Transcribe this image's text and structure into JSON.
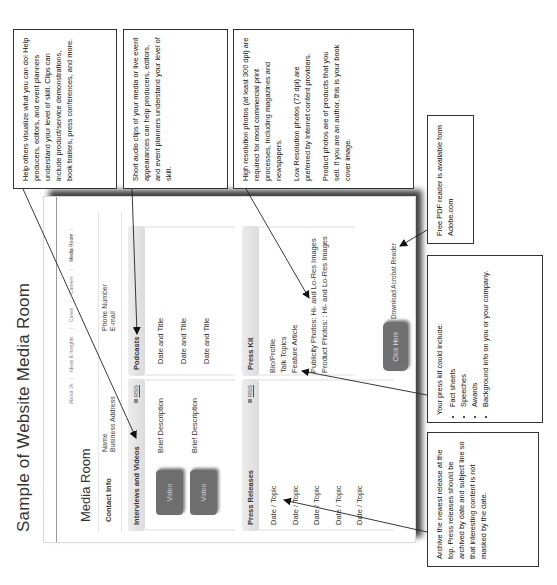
{
  "document": {
    "title": "Sample of Website Media Room"
  },
  "website": {
    "nav": {
      "items": [
        {
          "label": "About Us",
          "active": false
        },
        {
          "label": "Ideas & Insights",
          "active": false
        },
        {
          "label": "Cases",
          "active": false
        },
        {
          "label": "Careers",
          "active": false
        },
        {
          "label": "Media Room",
          "active": true
        }
      ]
    },
    "heading": "Media Room",
    "contact": {
      "label": "Contact Info",
      "name": "Name",
      "address": "Business Address",
      "phone": "Phone Number",
      "email": "E-mail"
    },
    "interviews": {
      "title": "Interviews and Videos",
      "rss": "RSS",
      "items": [
        {
          "button": "Video",
          "description": "Brief Description"
        },
        {
          "button": "Video",
          "description": "Brief Description"
        }
      ]
    },
    "podcasts": {
      "title": "Podcasts",
      "items": [
        "Date and Title",
        "Date and Title",
        "Date and Title"
      ]
    },
    "press_releases": {
      "title": "Press Releases",
      "rss": "RSS",
      "items": [
        "Date / Topic",
        "Date / Topic",
        "Date / Topic",
        "Date / Topic",
        "Date / Topic"
      ]
    },
    "press_kit": {
      "title": "Press Kit",
      "items": [
        "Bio/Profile",
        "Talk Topics",
        "Feature Article"
      ],
      "photos": [
        "Publicity Photos: Hi- and Lo-Res Images",
        "Product Photos: : Hi- and Lo-Res Images"
      ]
    },
    "acrobat": {
      "button": "Click Here",
      "text": "Download Acrobat Reader"
    }
  },
  "annotations": {
    "videos": "Help others visualize what you can do! Help producers, editors, and event planners understand your level of skill. Clips can include product/service demonstrations, book trailers, press conferences, and more.",
    "podcasts": "Short audio clips of your media or live event appearances can help producers, editors, and event planners understand your level of skill.",
    "photos": {
      "p1": "High resolution photos (at least 300 dpi) are required for most commercial print processes, including magazines and newspapers.",
      "p2": "Low Resolution photos (72 dpi) are preferred by Internet content providers.",
      "p3": "Product photos are of products that you sell. If you are an author, this is your book cover image."
    },
    "pdf_reader": "Free PDF reader is available form Adobe.com",
    "press_kit": {
      "intro": "Your press kit could include:",
      "bullets": [
        "Fact sheets",
        "Speeches",
        "Awards",
        "Background info on you or your company."
      ]
    },
    "press_releases": "Archive the newest release at the top. Press releases should be archived by date and subject line so that interesting content is not masked by the date."
  },
  "colors": {
    "button_gray": "#6e6e6e",
    "section_header": "#e2e2e2",
    "border": "#333333"
  }
}
